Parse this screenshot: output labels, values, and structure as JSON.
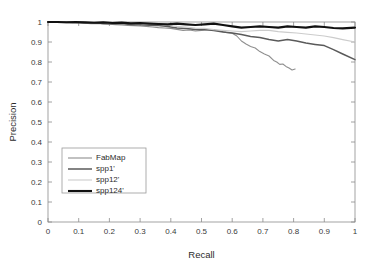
{
  "chart_data": {
    "type": "line",
    "title": "",
    "xlabel": "Recall",
    "ylabel": "Precision",
    "xlim": [
      0,
      1
    ],
    "ylim": [
      0,
      1
    ],
    "grid": false,
    "legend_position": "center-left",
    "xticks": [
      "0",
      "0.1",
      "0.2",
      "0.3",
      "0.4",
      "0.5",
      "0.6",
      "0.7",
      "0.8",
      "0.9",
      "1"
    ],
    "xtick_values": [
      0,
      0.1,
      0.2,
      0.3,
      0.4,
      0.5,
      0.6,
      0.7,
      0.8,
      0.9,
      1
    ],
    "yticks": [
      "0",
      "0.1",
      "0.2",
      "0.3",
      "0.4",
      "0.5",
      "0.6",
      "0.7",
      "0.8",
      "0.9",
      "1"
    ],
    "ytick_values": [
      0,
      0.1,
      0.2,
      0.3,
      0.4,
      0.5,
      0.6,
      0.7,
      0.8,
      0.9,
      1
    ],
    "series": [
      {
        "name": "FabMap",
        "color": "#8f8f8f",
        "width": 1.1,
        "x": [
          0.0,
          0.02,
          0.04,
          0.06,
          0.08,
          0.1,
          0.12,
          0.14,
          0.16,
          0.18,
          0.2,
          0.22,
          0.24,
          0.26,
          0.28,
          0.3,
          0.32,
          0.34,
          0.36,
          0.38,
          0.4,
          0.42,
          0.44,
          0.46,
          0.48,
          0.5,
          0.52,
          0.54,
          0.56,
          0.58,
          0.6,
          0.615,
          0.63,
          0.645,
          0.66,
          0.675,
          0.69,
          0.705,
          0.72,
          0.735,
          0.745,
          0.755,
          0.765,
          0.775,
          0.785,
          0.795,
          0.805
        ],
        "y": [
          1.0,
          1.0,
          0.998,
          0.999,
          0.997,
          0.996,
          0.994,
          0.992,
          0.993,
          0.99,
          0.989,
          0.987,
          0.985,
          0.983,
          0.982,
          0.98,
          0.978,
          0.975,
          0.972,
          0.97,
          0.968,
          0.963,
          0.958,
          0.96,
          0.955,
          0.958,
          0.96,
          0.962,
          0.955,
          0.948,
          0.944,
          0.93,
          0.905,
          0.89,
          0.878,
          0.87,
          0.852,
          0.84,
          0.83,
          0.808,
          0.8,
          0.788,
          0.79,
          0.778,
          0.77,
          0.76,
          0.765
        ],
        "x_end": 0.805,
        "y_end": 0.765
      },
      {
        "name": "spp1'",
        "color": "#5a5a5a",
        "width": 1.5,
        "x": [
          0.0,
          0.03,
          0.06,
          0.09,
          0.12,
          0.15,
          0.18,
          0.21,
          0.24,
          0.27,
          0.3,
          0.33,
          0.36,
          0.39,
          0.42,
          0.45,
          0.48,
          0.51,
          0.54,
          0.57,
          0.6,
          0.63,
          0.66,
          0.69,
          0.72,
          0.75,
          0.78,
          0.81,
          0.84,
          0.87,
          0.9,
          0.93,
          0.96,
          1.0
        ],
        "y": [
          1.0,
          0.999,
          0.998,
          0.997,
          0.995,
          0.996,
          0.993,
          0.991,
          0.992,
          0.988,
          0.986,
          0.984,
          0.982,
          0.978,
          0.97,
          0.968,
          0.963,
          0.962,
          0.958,
          0.95,
          0.945,
          0.938,
          0.928,
          0.922,
          0.912,
          0.905,
          0.912,
          0.905,
          0.895,
          0.888,
          0.882,
          0.862,
          0.84,
          0.812
        ],
        "x_end": 1.0,
        "y_end": 0.812
      },
      {
        "name": "spp12'",
        "color": "#cccccc",
        "width": 1.1,
        "x": [
          0.0,
          0.03,
          0.06,
          0.09,
          0.12,
          0.15,
          0.18,
          0.21,
          0.24,
          0.27,
          0.3,
          0.33,
          0.36,
          0.39,
          0.42,
          0.45,
          0.48,
          0.51,
          0.54,
          0.57,
          0.6,
          0.63,
          0.66,
          0.69,
          0.72,
          0.75,
          0.78,
          0.81,
          0.84,
          0.87,
          0.9,
          0.93,
          0.96,
          1.0
        ],
        "y": [
          1.0,
          1.0,
          0.999,
          0.998,
          0.997,
          0.997,
          0.996,
          0.994,
          0.995,
          0.992,
          0.991,
          0.99,
          0.988,
          0.984,
          0.978,
          0.975,
          0.97,
          0.968,
          0.962,
          0.958,
          0.955,
          0.952,
          0.955,
          0.958,
          0.958,
          0.952,
          0.948,
          0.945,
          0.94,
          0.935,
          0.93,
          0.922,
          0.912,
          0.9
        ],
        "x_end": 1.0,
        "y_end": 0.9
      },
      {
        "name": "spp124'",
        "color": "#111111",
        "width": 2.1,
        "x": [
          0.0,
          0.03,
          0.06,
          0.09,
          0.12,
          0.15,
          0.18,
          0.21,
          0.24,
          0.27,
          0.3,
          0.33,
          0.36,
          0.39,
          0.42,
          0.45,
          0.48,
          0.51,
          0.54,
          0.57,
          0.6,
          0.63,
          0.66,
          0.69,
          0.72,
          0.75,
          0.78,
          0.81,
          0.84,
          0.87,
          0.9,
          0.93,
          0.96,
          1.0
        ],
        "y": [
          1.0,
          1.0,
          0.999,
          1.0,
          0.998,
          0.996,
          0.998,
          0.995,
          0.997,
          0.993,
          0.995,
          0.992,
          0.99,
          0.988,
          0.992,
          0.988,
          0.985,
          0.988,
          0.992,
          0.985,
          0.978,
          0.972,
          0.975,
          0.978,
          0.975,
          0.972,
          0.978,
          0.975,
          0.972,
          0.978,
          0.975,
          0.97,
          0.968,
          0.972
        ],
        "x_end": 1.0,
        "y_end": 0.972
      }
    ]
  },
  "axes": {
    "xlabel": "Recall",
    "ylabel": "Precision"
  },
  "legend": {
    "items": [
      {
        "label": "FabMap"
      },
      {
        "label": "spp1'"
      },
      {
        "label": "spp12'"
      },
      {
        "label": "spp124'"
      }
    ]
  }
}
